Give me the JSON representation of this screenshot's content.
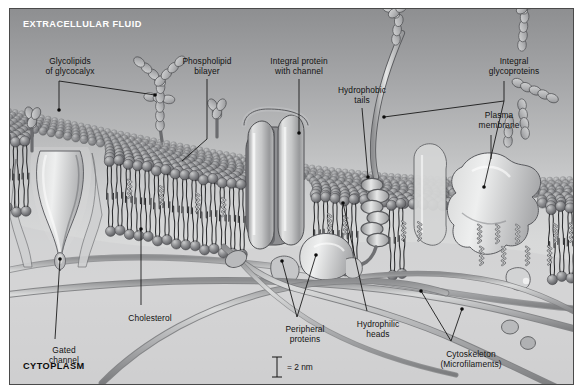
{
  "figure": {
    "headers": {
      "top": "EXTRACELLULAR FLUID",
      "bottom": "CYTOPLASM"
    },
    "scale_bar": {
      "text": "= 2 nm",
      "value": 2,
      "unit": "nm"
    },
    "palette": {
      "sky_top": "#8e8f91",
      "sky_bottom": "#d6d6d6",
      "head": "#6d6e70",
      "head_light": "#9a9b9d",
      "protein": "#c9cacb",
      "protein_shade": "#8d8e90",
      "filament": "#a8a9ab",
      "glyco": "#b9babc",
      "outline": "#3a3a3a",
      "frame": "#4a4a4a",
      "text": "#121212"
    },
    "labels": [
      {
        "id": "glycolipids",
        "text": "Glycolipids\nof glycocalyx",
        "x": 14,
        "y": 48,
        "w": 92
      },
      {
        "id": "phospholipid-bilayer",
        "text": "Phospholipid\nbilayer",
        "x": 157,
        "y": 48,
        "w": 80
      },
      {
        "id": "integral-protein-channel",
        "text": "Integral protein\nwith channel",
        "x": 243,
        "y": 48,
        "w": 92
      },
      {
        "id": "hydrophobic-tails",
        "text": "Hydrophobic\ntails",
        "x": 312,
        "y": 77,
        "w": 80
      },
      {
        "id": "integral-glycoproteins",
        "text": "Integral\nglycoproteins",
        "x": 461,
        "y": 48,
        "w": 86
      },
      {
        "id": "plasma-membrane",
        "text": "Plasma\nmembrane",
        "x": 451,
        "y": 102,
        "w": 76
      },
      {
        "id": "cholesterol",
        "text": "Cholesterol",
        "x": 105,
        "y": 305,
        "w": 70
      },
      {
        "id": "gated-channel",
        "text": "Gated\nchannel",
        "x": 22,
        "y": 337,
        "w": 64
      },
      {
        "id": "peripheral-proteins",
        "text": "Peripheral\nproteins",
        "x": 259,
        "y": 316,
        "w": 72
      },
      {
        "id": "hydrophilic-heads",
        "text": "Hydrophilic\nheads",
        "x": 330,
        "y": 311,
        "w": 76
      },
      {
        "id": "cytoskeleton",
        "text": "Cytoskeleton\n(Microfilaments)",
        "x": 409,
        "y": 341,
        "w": 104
      }
    ],
    "structures": [
      {
        "id": "glycolipid-chain-left",
        "kind": "glycolipid"
      },
      {
        "id": "glycolipid-chain-mid",
        "kind": "glycolipid"
      },
      {
        "id": "glycolipid-chain-small",
        "kind": "glycolipid"
      },
      {
        "id": "glycoprotein-chain-top",
        "kind": "glycoprotein"
      },
      {
        "id": "glycoprotein-chain-right",
        "kind": "glycoprotein"
      },
      {
        "id": "integral-protein-channel-body",
        "kind": "integral-protein"
      },
      {
        "id": "gated-channel-body",
        "kind": "gated-channel"
      },
      {
        "id": "integral-glycoprotein-right",
        "kind": "integral-protein"
      },
      {
        "id": "peripheral-protein-left",
        "kind": "peripheral-protein"
      },
      {
        "id": "peripheral-protein-center",
        "kind": "peripheral-protein"
      },
      {
        "id": "microfilament-1",
        "kind": "filament"
      },
      {
        "id": "microfilament-2",
        "kind": "filament"
      },
      {
        "id": "microfilament-3",
        "kind": "filament"
      },
      {
        "id": "microfilament-4",
        "kind": "filament"
      },
      {
        "id": "cholesterol-molecules",
        "kind": "cholesterol"
      },
      {
        "id": "phospholipid-bilayer-sheet",
        "kind": "bilayer"
      }
    ]
  }
}
